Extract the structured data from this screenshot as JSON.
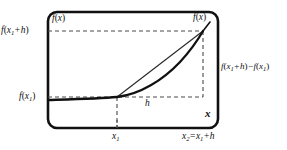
{
  "figure": {
    "frame": {
      "x": 48,
      "y": 12,
      "width": 170,
      "height": 116,
      "corner_radius": 9,
      "stroke": "#111111",
      "stroke_width": 2.6
    },
    "colors": {
      "ink": "#111111",
      "curve": "#111111",
      "secant": "#2b2b2b",
      "dashed": "#4a4a4a",
      "background": "#ffffff"
    },
    "labels": {
      "f_x1_plus_h": {
        "name": "f(x1 + h)",
        "f": "f",
        "open": "(",
        "var": "x",
        "sub": "1",
        "op": "+",
        "h": "h",
        "close": ")"
      },
      "f_x1": {
        "name": "f(x1)",
        "f": "f",
        "open": "(",
        "var": "x",
        "sub": "1",
        "close": ")"
      },
      "f_of_x_top_left": {
        "name": "f(x)",
        "f": "f",
        "open": "(",
        "var": "x",
        "close": ")"
      },
      "f_of_x_top_right": {
        "name": "f(x)",
        "f": "f",
        "open": "(",
        "var": "x",
        "close": ")"
      },
      "difference": {
        "name": "f(x1 + h) - f(x1)",
        "f": "f",
        "open": "(",
        "var": "x",
        "sub": "1",
        "plus": "+",
        "h": "h",
        "close": ")",
        "minus": "−"
      },
      "h_gap": {
        "name": "h",
        "text": "h"
      },
      "x_axis": {
        "name": "x",
        "text": "x"
      },
      "x1_tick": {
        "name": "x1",
        "var": "x",
        "sub": "1"
      },
      "x2_tick": {
        "name": "x2 = x1 + h",
        "var": "x",
        "sub2": "2",
        "eq": "=",
        "var1": "x",
        "sub1": "1",
        "op": "+",
        "h": "h"
      }
    },
    "geometry": {
      "x1_px": 117,
      "x2_px": 203,
      "y_fx1_px": 97,
      "y_fx1h_px": 31,
      "curve_start_px": {
        "x": 48,
        "y": 100
      },
      "curve_path": "M 48 100 C 75 99.2 100 98.6 117 97 C 140 94.5 163 80 180 62 C 192 49 199 38 203 31",
      "secant_path": "M 117 97 L 203 31",
      "dashed_horizontal_top": {
        "x1": 48,
        "x2": 203,
        "y": 31
      },
      "dashed_horizontal_bottom": {
        "x1": 48,
        "x2": 203,
        "y": 97
      },
      "dashed_vertical_x1": {
        "x": 117,
        "y1": 97,
        "y2": 128
      },
      "dashed_vertical_x2": {
        "x": 203,
        "y1": 31,
        "y2": 97
      },
      "tick_x1": {
        "x": 117,
        "y1": 120,
        "y2": 128
      },
      "dash_pattern": "4,3"
    }
  }
}
